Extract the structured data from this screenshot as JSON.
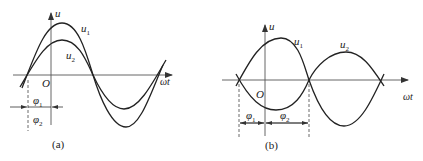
{
  "figures": [
    {
      "id": "a",
      "caption": "(a)",
      "axis_y_label": "u",
      "axis_x_label": "ωt",
      "origin_label": "O",
      "curves": [
        {
          "name": "u1",
          "label": "u",
          "sub": "1",
          "amplitude": "larger",
          "phase": "φ1"
        },
        {
          "name": "u2",
          "label": "u",
          "sub": "2",
          "amplitude": "smaller",
          "phase": "φ2"
        }
      ],
      "phase_labels": [
        {
          "label": "φ",
          "sub": "1"
        },
        {
          "label": "φ",
          "sub": "2"
        }
      ],
      "note": "u1 and u2 in phase (φ1 = φ2)"
    },
    {
      "id": "b",
      "caption": "(b)",
      "axis_y_label": "u",
      "axis_x_label": "ωt",
      "origin_label": "O",
      "curves": [
        {
          "name": "u1",
          "label": "u",
          "sub": "1"
        },
        {
          "name": "u2",
          "label": "u",
          "sub": "2"
        }
      ],
      "phase_labels": [
        {
          "label": "φ",
          "sub": "1"
        },
        {
          "label": "φ",
          "sub": "2"
        }
      ],
      "note": "u1 and u2 in antiphase (φ1 + φ2 = π)"
    }
  ]
}
